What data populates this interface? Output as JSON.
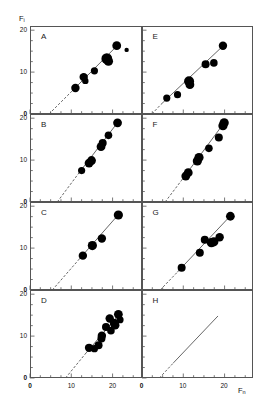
{
  "figure": {
    "title": "",
    "y_axis_label": "F",
    "y_axis_sub": "i",
    "x_axis_label": "F",
    "x_axis_sub": "n",
    "panel_letters": [
      "A",
      "B",
      "C",
      "D",
      "E",
      "F",
      "G",
      "H"
    ],
    "y_ticks": [
      "0",
      "10",
      "20"
    ],
    "x_ticks": [
      "0",
      "10",
      "20"
    ],
    "x_zero_label": "0"
  },
  "chart_data": {
    "type": "scatter",
    "title": "",
    "xlabel": "Fn",
    "ylabel": "Fi",
    "xlim": [
      0,
      27
    ],
    "ylim": [
      0,
      21
    ],
    "grid": false,
    "legend": "none",
    "marker_color": "#000000",
    "line_color": "#555555",
    "panels": [
      {
        "name": "A",
        "points": [
          {
            "x": 11.0,
            "y": 6.2,
            "size": 4.2
          },
          {
            "x": 13.0,
            "y": 8.8,
            "size": 4.2
          },
          {
            "x": 13.4,
            "y": 7.9,
            "size": 3.2
          },
          {
            "x": 15.6,
            "y": 10.3,
            "size": 3.6
          },
          {
            "x": 18.6,
            "y": 13.2,
            "size": 5.4
          },
          {
            "x": 19.0,
            "y": 12.6,
            "size": 4.6
          },
          {
            "x": 21.0,
            "y": 16.3,
            "size": 4.4
          },
          {
            "x": 23.4,
            "y": 15.3,
            "size": 2.2
          }
        ],
        "fit_line": {
          "x0": 10.0,
          "y0": 5.3,
          "x1": 21.4,
          "y1": 16.6
        },
        "dashed_extension": {
          "x0": 4.6,
          "y0": 0.0,
          "x1": 10.0,
          "y1": 5.3
        }
      },
      {
        "name": "B",
        "points": [
          {
            "x": 12.5,
            "y": 7.5,
            "size": 3.6
          },
          {
            "x": 14.3,
            "y": 9.3,
            "size": 4.4
          },
          {
            "x": 14.9,
            "y": 9.9,
            "size": 4.4
          },
          {
            "x": 17.2,
            "y": 13.2,
            "size": 4.4
          },
          {
            "x": 17.6,
            "y": 14.1,
            "size": 4.0
          },
          {
            "x": 19.0,
            "y": 15.9,
            "size": 3.8
          },
          {
            "x": 21.2,
            "y": 18.9,
            "size": 4.4
          }
        ],
        "fit_line": {
          "x0": 11.6,
          "y0": 6.6,
          "x1": 21.4,
          "y1": 19.2
        },
        "dashed_extension": {
          "x0": 6.6,
          "y0": 0.0,
          "x1": 11.6,
          "y1": 6.6
        }
      },
      {
        "name": "C",
        "points": [
          {
            "x": 12.8,
            "y": 8.2,
            "size": 4.2
          },
          {
            "x": 15.1,
            "y": 10.6,
            "size": 4.6
          },
          {
            "x": 17.4,
            "y": 12.3,
            "size": 4.2
          },
          {
            "x": 21.4,
            "y": 17.9,
            "size": 4.6
          }
        ],
        "fit_line": {
          "x0": 11.6,
          "y0": 7.0,
          "x1": 21.6,
          "y1": 18.2
        },
        "dashed_extension": {
          "x0": 5.4,
          "y0": 0.0,
          "x1": 11.6,
          "y1": 7.0
        }
      },
      {
        "name": "D",
        "points": [
          {
            "x": 14.3,
            "y": 7.2,
            "size": 4.2
          },
          {
            "x": 15.6,
            "y": 7.0,
            "size": 3.6
          },
          {
            "x": 16.6,
            "y": 7.8,
            "size": 4.0
          },
          {
            "x": 17.3,
            "y": 9.4,
            "size": 4.0
          },
          {
            "x": 17.4,
            "y": 10.1,
            "size": 4.2
          },
          {
            "x": 18.4,
            "y": 12.2,
            "size": 4.0
          },
          {
            "x": 19.3,
            "y": 14.2,
            "size": 4.2
          },
          {
            "x": 19.6,
            "y": 11.3,
            "size": 3.8
          },
          {
            "x": 20.3,
            "y": 13.2,
            "size": 4.0
          },
          {
            "x": 20.6,
            "y": 12.6,
            "size": 4.4
          },
          {
            "x": 21.4,
            "y": 15.2,
            "size": 4.4
          },
          {
            "x": 21.8,
            "y": 13.9,
            "size": 3.6
          }
        ],
        "fit_line": {
          "x0": 13.6,
          "y0": 6.0,
          "x1": 21.8,
          "y1": 15.4
        },
        "dashed_extension": {
          "x0": 8.6,
          "y0": 0.0,
          "x1": 13.6,
          "y1": 6.0
        }
      },
      {
        "name": "E",
        "points": [
          {
            "x": 6.0,
            "y": 3.8,
            "size": 3.6
          },
          {
            "x": 8.6,
            "y": 4.6,
            "size": 3.6
          },
          {
            "x": 11.4,
            "y": 7.8,
            "size": 5.0
          },
          {
            "x": 11.6,
            "y": 7.0,
            "size": 4.4
          },
          {
            "x": 15.4,
            "y": 11.9,
            "size": 4.0
          },
          {
            "x": 17.4,
            "y": 12.2,
            "size": 3.8
          },
          {
            "x": 19.6,
            "y": 16.3,
            "size": 4.2
          }
        ],
        "fit_line": {
          "x0": 4.6,
          "y0": 2.3,
          "x1": 20.0,
          "y1": 16.6
        },
        "dashed_extension": {
          "x0": 2.4,
          "y0": 0.0,
          "x1": 4.6,
          "y1": 2.3
        }
      },
      {
        "name": "F",
        "points": [
          {
            "x": 10.6,
            "y": 6.2,
            "size": 4.4
          },
          {
            "x": 11.2,
            "y": 7.0,
            "size": 4.4
          },
          {
            "x": 13.4,
            "y": 9.8,
            "size": 4.6
          },
          {
            "x": 13.8,
            "y": 10.6,
            "size": 4.6
          },
          {
            "x": 16.2,
            "y": 12.8,
            "size": 3.8
          },
          {
            "x": 18.6,
            "y": 15.4,
            "size": 4.0
          },
          {
            "x": 19.6,
            "y": 18.2,
            "size": 4.6
          },
          {
            "x": 19.9,
            "y": 18.9,
            "size": 4.6
          }
        ],
        "fit_line": {
          "x0": 9.6,
          "y0": 5.2,
          "x1": 20.2,
          "y1": 19.3
        },
        "dashed_extension": {
          "x0": 5.6,
          "y0": 0.0,
          "x1": 9.6,
          "y1": 5.2
        }
      },
      {
        "name": "G",
        "points": [
          {
            "x": 9.6,
            "y": 5.3,
            "size": 4.0
          },
          {
            "x": 14.0,
            "y": 8.9,
            "size": 4.0
          },
          {
            "x": 15.2,
            "y": 12.0,
            "size": 4.0
          },
          {
            "x": 16.8,
            "y": 11.3,
            "size": 4.6
          },
          {
            "x": 17.4,
            "y": 11.5,
            "size": 4.6
          },
          {
            "x": 18.8,
            "y": 12.6,
            "size": 4.2
          },
          {
            "x": 21.4,
            "y": 17.6,
            "size": 4.4
          }
        ],
        "fit_line": {
          "x0": 8.6,
          "y0": 4.3,
          "x1": 21.6,
          "y1": 17.9
        },
        "dashed_extension": {
          "x0": 4.4,
          "y0": 0.0,
          "x1": 8.6,
          "y1": 4.3
        }
      },
      {
        "name": "H",
        "points": [],
        "fit_line": {
          "x0": 7.6,
          "y0": 3.6,
          "x1": 18.4,
          "y1": 14.8
        },
        "dashed_extension": {
          "x0": 4.2,
          "y0": 0.0,
          "x1": 7.6,
          "y1": 3.6
        }
      }
    ]
  }
}
